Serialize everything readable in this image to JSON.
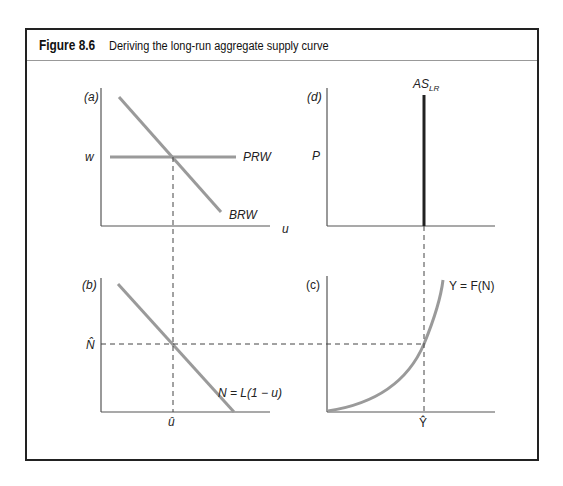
{
  "figure": {
    "number": "Figure 8.6",
    "caption": "Deriving the long-run aggregate supply curve"
  },
  "panels": {
    "a": {
      "tag": "(a)",
      "y_label": "w",
      "x_label": "u",
      "curves": [
        "PRW",
        "BRW"
      ]
    },
    "d": {
      "tag": "(d)",
      "y_label": "P",
      "curves": [
        "AS"
      ],
      "curve_subscript": "LR"
    },
    "b": {
      "tag": "(b)",
      "y_label": "N̂",
      "x_label": "û",
      "curves": [
        "N = L(1 − u)"
      ]
    },
    "c": {
      "tag": "(c)",
      "x_label": "Ŷ",
      "curves": [
        "Y = F(N)"
      ]
    }
  },
  "colors": {
    "curve": "#9a9a9a",
    "axis": "#555555",
    "as_line": "#222222",
    "frame": "#222222"
  }
}
